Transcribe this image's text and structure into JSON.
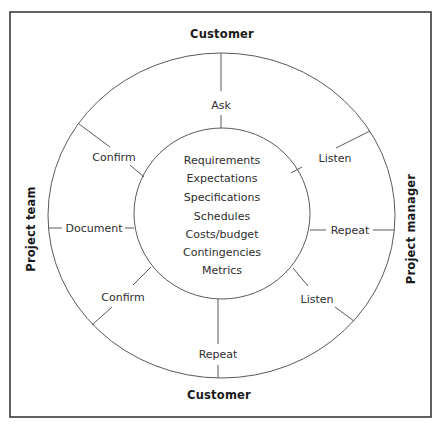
{
  "diagram": {
    "colors": {
      "frame": "#3a3a3a",
      "lines": "#5a5a5a",
      "text": "#2e2e2e",
      "edge_text": "#1a1a1a",
      "background": "#ffffff"
    },
    "edges": {
      "top": "Customer",
      "bottom": "Customer",
      "left": "Project team",
      "right": "Project manager"
    },
    "spokes": {
      "top": "Ask",
      "upper_right": "Listen",
      "right": "Repeat",
      "lower_right": "Listen",
      "bottom": "Repeat",
      "lower_left": "Confirm",
      "left": "Document",
      "upper_left": "Confirm"
    },
    "center_items": [
      "Requirements",
      "Expectations",
      "Specifications",
      "Schedules",
      "Costs/budget",
      "Contingencies",
      "Metrics"
    ]
  }
}
